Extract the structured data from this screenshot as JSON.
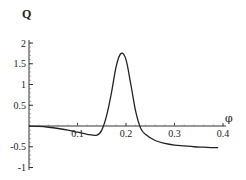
{
  "chart_data": {
    "type": "line",
    "title": "",
    "xlabel": "φ",
    "ylabel": "Q",
    "xlim": [
      0,
      0.4
    ],
    "ylim": [
      -1,
      2
    ],
    "grid": false,
    "legend": null,
    "x_ticks": [
      "0.1",
      "0.2",
      "0.3",
      "0.4"
    ],
    "y_ticks": [
      "2",
      "1.5",
      "1",
      "0.5",
      "-0.5",
      "-1"
    ],
    "series": [
      {
        "name": "Q(φ)",
        "x": [
          0,
          0.02,
          0.04,
          0.06,
          0.08,
          0.1,
          0.12,
          0.14,
          0.15,
          0.16,
          0.17,
          0.18,
          0.19,
          0.2,
          0.21,
          0.22,
          0.23,
          0.24,
          0.26,
          0.28,
          0.3,
          0.32,
          0.34,
          0.36,
          0.38,
          0.39
        ],
        "values": [
          0,
          -0.01,
          -0.03,
          -0.06,
          -0.1,
          -0.15,
          -0.2,
          -0.22,
          -0.1,
          0.25,
          0.8,
          1.45,
          1.75,
          1.6,
          1.0,
          0.35,
          -0.05,
          -0.2,
          -0.35,
          -0.42,
          -0.46,
          -0.48,
          -0.5,
          -0.51,
          -0.52,
          -0.52
        ]
      }
    ]
  }
}
